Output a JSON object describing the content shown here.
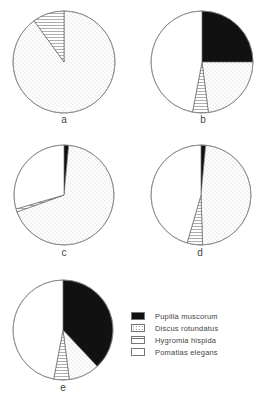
{
  "chart_data": [
    {
      "type": "pie",
      "title": "a",
      "categories": [
        "Pupilla muscorum",
        "Discus rotundatus",
        "Hygromia hispida",
        "Pomatias elegans"
      ],
      "values": [
        0,
        90,
        10,
        0
      ],
      "unit": "%"
    },
    {
      "type": "pie",
      "title": "b",
      "categories": [
        "Pupilla muscorum",
        "Discus rotundatus",
        "Hygromia hispida",
        "Pomatias elegans"
      ],
      "values": [
        25,
        23,
        5,
        47
      ],
      "unit": "%"
    },
    {
      "type": "pie",
      "title": "c",
      "categories": [
        "Pupilla muscorum",
        "Discus rotundatus",
        "Hygromia hispida",
        "Pomatias elegans"
      ],
      "values": [
        1.5,
        68,
        1,
        29.5
      ],
      "unit": "%"
    },
    {
      "type": "pie",
      "title": "d",
      "categories": [
        "Pupilla muscorum",
        "Discus rotundatus",
        "Hygromia hispida",
        "Pomatias elegans"
      ],
      "values": [
        1.5,
        48,
        5,
        45.5
      ],
      "unit": "%"
    },
    {
      "type": "pie",
      "title": "e",
      "categories": [
        "Pupilla muscorum",
        "Discus rotundatus",
        "Hygromia hispida",
        "Pomatias elegans"
      ],
      "values": [
        38,
        10,
        5,
        47
      ],
      "unit": "%"
    }
  ],
  "pies": [
    {
      "label": "a",
      "cx": 64,
      "cy": 62,
      "r": 51,
      "label_x": 64,
      "label_y": 114
    },
    {
      "label": "b",
      "cx": 202,
      "cy": 62,
      "r": 51,
      "label_x": 203,
      "label_y": 114
    },
    {
      "label": "c",
      "cx": 64,
      "cy": 195,
      "r": 50,
      "label_x": 64,
      "label_y": 247
    },
    {
      "label": "d",
      "cx": 201,
      "cy": 195,
      "r": 50,
      "label_x": 200,
      "label_y": 247
    },
    {
      "label": "e",
      "cx": 63,
      "cy": 330,
      "r": 50,
      "label_x": 63,
      "label_y": 382
    }
  ],
  "legend": {
    "items": [
      {
        "label": "Pupilla muscorum",
        "pattern": "solid-black"
      },
      {
        "label": "Discus rotundatus",
        "pattern": "dotted"
      },
      {
        "label": "Hygromia hispida",
        "pattern": "horizontal-hatch"
      },
      {
        "label": "Pomatias elegans",
        "pattern": "white"
      }
    ]
  }
}
